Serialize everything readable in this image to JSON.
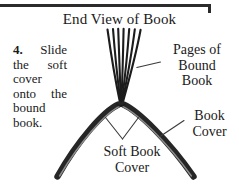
{
  "figure": {
    "title": "End View of Book",
    "type": "instructional-line-diagram"
  },
  "instruction": {
    "step_number": "4.",
    "text": "Slide the soft cover onto the bound book.",
    "full_text": "4. Slide the soft cover onto the bound book."
  },
  "labels": {
    "pages": {
      "line1": "Pages of",
      "line2": "Bound",
      "line3": "Book"
    },
    "book_cover": {
      "line1": "Book",
      "line2": "Cover"
    },
    "soft_book_cover": {
      "line1": "Soft Book",
      "line2": "Cover"
    }
  },
  "art": {
    "page_count": 7,
    "ink_color": "#1c1c1c",
    "cover_color": "#2a2a2a",
    "leader_color": "#3a3a3a",
    "background": "#ffffff"
  }
}
